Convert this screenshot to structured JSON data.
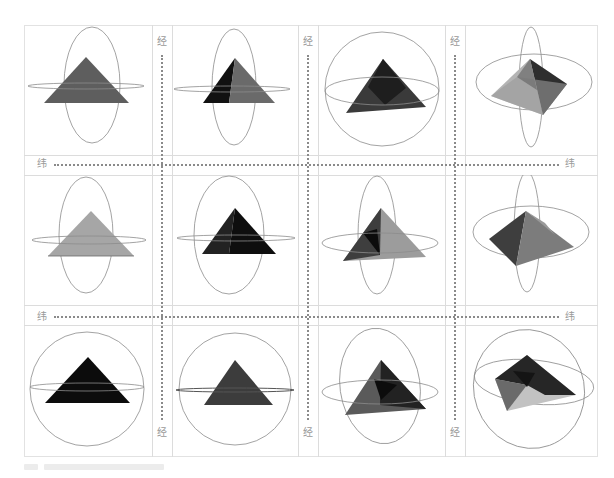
{
  "labels": {
    "longitude": "经",
    "latitude": "纬"
  },
  "grid": {
    "rows": 3,
    "cols": 4,
    "description": "Pyramid shown inside latitude/longitude rings under 12 viewing orientations"
  },
  "colors": {
    "ring": "#8c8c8c",
    "grid_line": "#dcdcdc",
    "dotted_guide": "#8a8a8a",
    "label_text": "#9a9a9a",
    "face_black": "#111111",
    "face_dark": "#3a3a3a",
    "face_mid": "#5e5e5e",
    "face_light": "#a6a6a6",
    "face_pale": "#c4c4c4"
  },
  "cells": [
    {
      "row": 1,
      "col": 1,
      "shape": "pyramid-front",
      "ring": "vertical-ellipse"
    },
    {
      "row": 1,
      "col": 2,
      "shape": "pyramid-two-face",
      "ring": "vertical-ellipse"
    },
    {
      "row": 1,
      "col": 3,
      "shape": "pyramid-tilted",
      "ring": "circle"
    },
    {
      "row": 1,
      "col": 4,
      "shape": "pyramid-oblique",
      "ring": "crossed-ellipses"
    },
    {
      "row": 2,
      "col": 1,
      "shape": "pyramid-front-light",
      "ring": "vertical-ellipse"
    },
    {
      "row": 2,
      "col": 2,
      "shape": "pyramid-front-black",
      "ring": "vertical-ellipse"
    },
    {
      "row": 2,
      "col": 3,
      "shape": "pyramid-tilted-multi",
      "ring": "vertical-ellipse"
    },
    {
      "row": 2,
      "col": 4,
      "shape": "pyramid-rotated",
      "ring": "crossed-ellipses"
    },
    {
      "row": 3,
      "col": 1,
      "shape": "pyramid-front-black",
      "ring": "circle"
    },
    {
      "row": 3,
      "col": 2,
      "shape": "pyramid-front-dark",
      "ring": "circle"
    },
    {
      "row": 3,
      "col": 3,
      "shape": "pyramid-tilted-dark",
      "ring": "tilted-ellipse"
    },
    {
      "row": 3,
      "col": 4,
      "shape": "pyramid-top-view",
      "ring": "tilted-ellipses"
    }
  ],
  "caption": {
    "text": ""
  }
}
